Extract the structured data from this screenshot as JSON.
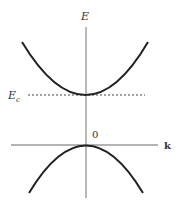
{
  "diagram": {
    "type": "band-structure",
    "labels": {
      "energy_axis": "E",
      "momentum_axis": "k",
      "conduction_edge_main": "E",
      "conduction_edge_sub": "c",
      "origin": "0"
    },
    "curves": [
      {
        "name": "conduction-band",
        "shape": "upward parabola",
        "vertex_at": "E_c"
      },
      {
        "name": "valence-band",
        "shape": "downward parabola",
        "vertex_at": "0"
      }
    ],
    "colors": {
      "curve": "#222222",
      "axis": "#888888",
      "dashed": "#444444"
    }
  }
}
